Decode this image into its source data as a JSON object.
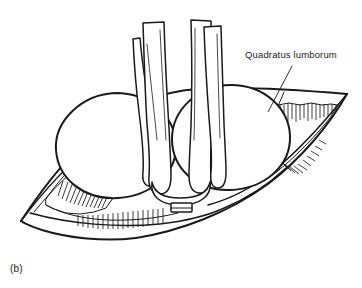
{
  "figure": {
    "panel_label": "(b)",
    "domain_kind": "anatomical-line-drawing",
    "background_color": "#ffffff",
    "ink_color": "#1a1a1a"
  },
  "annotations": [
    {
      "id": "quadratus-lumborum",
      "text": "Quadratus lumborum",
      "leader_from": {
        "x": 292,
        "y": 66
      },
      "leader_to": {
        "x": 268,
        "y": 112
      }
    }
  ],
  "structures": {
    "cavity_outline": {
      "name": "body-wall-lens-outline",
      "left_vertex": {
        "x": 21,
        "y": 221
      },
      "right_vertex": {
        "x": 347,
        "y": 94
      }
    },
    "organs": [
      {
        "name": "left-kidney",
        "cx": 116,
        "cy": 142,
        "rx": 58,
        "ry": 49
      },
      {
        "name": "right-kidney",
        "cx": 232,
        "cy": 135,
        "rx": 57,
        "ry": 50
      }
    ],
    "tubes": [
      {
        "name": "tube-far-left",
        "top_y": 38
      },
      {
        "name": "tube-mid-left",
        "top_y": 22
      },
      {
        "name": "tube-mid-right",
        "top_y": 20
      },
      {
        "name": "tube-far-right",
        "top_y": 26
      }
    ],
    "muscle_regions": [
      {
        "name": "quadratus-lumborum-right",
        "hatch_count": 34
      },
      {
        "name": "quadratus-lumborum-left",
        "hatch_count": 30
      }
    ]
  }
}
